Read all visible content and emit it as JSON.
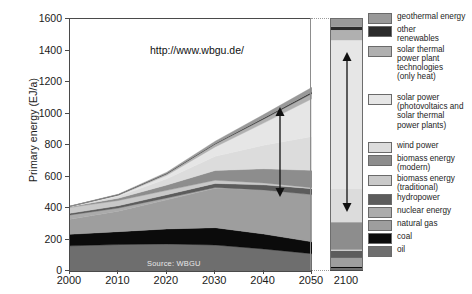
{
  "chart_data": {
    "type": "area",
    "title": "",
    "xlabel": "",
    "ylabel": "Primary energy (EJ/a)",
    "url_annotation": "http://www.wbgu.de/",
    "source_note": "Source: WBGU",
    "ylim": [
      0,
      1600
    ],
    "yticks": [
      0,
      200,
      400,
      600,
      800,
      1000,
      1200,
      1400,
      1600
    ],
    "xticks": [
      "2000",
      "2010",
      "2020",
      "2030",
      "2040",
      "2050"
    ],
    "extra_xtick": "2100",
    "grid": false,
    "legend_position": "right",
    "x": [
      2000,
      2010,
      2020,
      2030,
      2040,
      2050
    ],
    "series": [
      {
        "name": "oil",
        "color": "#6e6e6e",
        "values": [
          160,
          168,
          172,
          165,
          140,
          110
        ]
      },
      {
        "name": "coal",
        "color": "#0b0b0b",
        "values": [
          73,
          82,
          95,
          110,
          95,
          75
        ]
      },
      {
        "name": "natural gas",
        "color": "#9e9e9e",
        "values": [
          95,
          130,
          185,
          250,
          280,
          300
        ]
      },
      {
        "name": "nuclear energy",
        "color": "#ababab",
        "values": [
          28,
          20,
          12,
          5,
          0,
          0
        ]
      },
      {
        "name": "hydropower",
        "color": "#5c5c5c",
        "values": [
          10,
          14,
          20,
          26,
          32,
          38
        ]
      },
      {
        "name": "biomass energy (traditional)",
        "color": "#c9c9c9",
        "values": [
          38,
          34,
          28,
          20,
          12,
          6
        ]
      },
      {
        "name": "biomass energy (modern)",
        "color": "#8d8d8d",
        "values": [
          4,
          14,
          34,
          62,
          90,
          110
        ]
      },
      {
        "name": "wind power",
        "color": "#dcdcdc",
        "values": [
          1,
          12,
          40,
          90,
          150,
          215
        ]
      },
      {
        "name": "solar power (photovoltaics and solar thermal power plants)",
        "color": "#e6e6e6",
        "values": [
          1,
          6,
          22,
          60,
          140,
          240
        ]
      },
      {
        "name": "solar thermal power plant technologies (only heat)",
        "color": "#b0b0b0",
        "values": [
          1,
          4,
          10,
          18,
          26,
          34
        ]
      },
      {
        "name": "other renewables",
        "color": "#2b2b2b",
        "values": [
          0,
          1,
          2,
          4,
          6,
          8
        ]
      },
      {
        "name": "geothermal energy",
        "color": "#999999",
        "values": [
          1,
          3,
          7,
          14,
          22,
          30
        ]
      }
    ],
    "total_2050": 1166,
    "column_2100": {
      "label": "2100",
      "total": 1600,
      "stack": [
        {
          "name": "oil",
          "color": "#6e6e6e",
          "value": 18
        },
        {
          "name": "coal",
          "color": "#0b0b0b",
          "value": 10
        },
        {
          "name": "natural gas",
          "color": "#9e9e9e",
          "value": 55
        },
        {
          "name": "nuclear energy",
          "color": "#ababab",
          "value": 0
        },
        {
          "name": "hydropower",
          "color": "#5c5c5c",
          "value": 46
        },
        {
          "name": "biomass energy (traditional)",
          "color": "#c9c9c9",
          "value": 6
        },
        {
          "name": "biomass energy (modern)",
          "color": "#8d8d8d",
          "value": 175
        },
        {
          "name": "wind power",
          "color": "#dcdcdc",
          "value": 215
        },
        {
          "name": "solar power (photovoltaics and solar thermal power plants)",
          "color": "#e6e6e6",
          "value": 940
        },
        {
          "name": "solar thermal power plant technologies (only heat)",
          "color": "#b0b0b0",
          "value": 65
        },
        {
          "name": "other renewables",
          "color": "#2b2b2b",
          "value": 20
        },
        {
          "name": "geothermal energy",
          "color": "#999999",
          "value": 50
        }
      ]
    },
    "annotations": [
      {
        "name": "arrow-2050-solar",
        "type": "double-arrow",
        "note": "solar power band extent at 2050"
      },
      {
        "name": "arrow-2100-solar",
        "type": "double-arrow",
        "note": "solar power band extent at 2100"
      }
    ]
  },
  "legend": {
    "items": [
      {
        "label": "geothermal energy",
        "color": "#999999"
      },
      {
        "label": "other\nrenewables",
        "color": "#2b2b2b"
      },
      {
        "label": "solar thermal\npower plant\ntechnologies\n(only heat)",
        "color": "#b0b0b0"
      },
      {
        "label": "solar power\n(photovoltaics and\nsolar thermal\npower plants)",
        "color": "#e6e6e6"
      },
      {
        "label": "wind power",
        "color": "#dcdcdc"
      },
      {
        "label": "biomass energy\n(modern)",
        "color": "#8d8d8d"
      },
      {
        "label": "biomass energy\n(traditional)",
        "color": "#c9c9c9"
      },
      {
        "label": "hydropower",
        "color": "#5c5c5c"
      },
      {
        "label": "nuclear energy",
        "color": "#ababab"
      },
      {
        "label": "natural gas",
        "color": "#9e9e9e"
      },
      {
        "label": "coal",
        "color": "#0b0b0b"
      },
      {
        "label": "oil",
        "color": "#6e6e6e"
      }
    ],
    "labels": {
      "geothermal": "geothermal energy",
      "other_renewables_l1": "other",
      "other_renewables_l2": "renewables",
      "solar_thermal_l1": "solar thermal",
      "solar_thermal_l2": "power plant",
      "solar_thermal_l3": "technologies",
      "solar_thermal_l4": "(only heat)",
      "solar_power_l1": "solar power",
      "solar_power_l2": "(photovoltaics and",
      "solar_power_l3": "solar thermal",
      "solar_power_l4": "power plants)",
      "wind": "wind power",
      "biomass_modern_l1": "biomass energy",
      "biomass_modern_l2": "(modern)",
      "biomass_trad_l1": "biomass energy",
      "biomass_trad_l2": "(traditional)",
      "hydro": "hydropower",
      "nuclear": "nuclear energy",
      "gas": "natural gas",
      "coal": "coal",
      "oil": "oil"
    }
  },
  "axes": {
    "y_title": "Primary energy (EJ/a)",
    "y_ticks": [
      "1600",
      "1400",
      "1200",
      "1000",
      "800",
      "600",
      "400",
      "200",
      "0"
    ],
    "x_ticks": [
      "2000",
      "2010",
      "2020",
      "2030",
      "2040",
      "2050"
    ],
    "x_tick_far": "2100"
  }
}
